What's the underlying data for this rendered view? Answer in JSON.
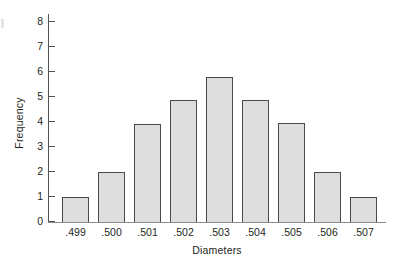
{
  "figure": {
    "background_color": "#ffffff",
    "axis_color": "#555558",
    "baseline_color": "#8a8a8d",
    "bar_fill_color": "#dedede",
    "bar_border_color": "#4a4a4d"
  },
  "chart_data": {
    "type": "bar",
    "title": "",
    "subtitle": "",
    "xlabel": "Diameters",
    "ylabel": "Frequency",
    "categories": [
      ".499",
      ".500",
      ".501",
      ".502",
      ".503",
      ".504",
      ".505",
      ".506",
      ".507"
    ],
    "values": [
      1,
      2,
      3.9,
      4.85,
      5.8,
      4.85,
      3.95,
      2,
      1
    ],
    "ylim": [
      0,
      8
    ],
    "yticks": [
      0,
      1,
      2,
      3,
      4,
      5,
      6,
      7,
      8
    ],
    "ytick_labels": [
      "0",
      "1",
      "2",
      "3",
      "4",
      "5",
      "6",
      "7",
      "8"
    ],
    "grid": false,
    "legend": null,
    "annotations": []
  }
}
